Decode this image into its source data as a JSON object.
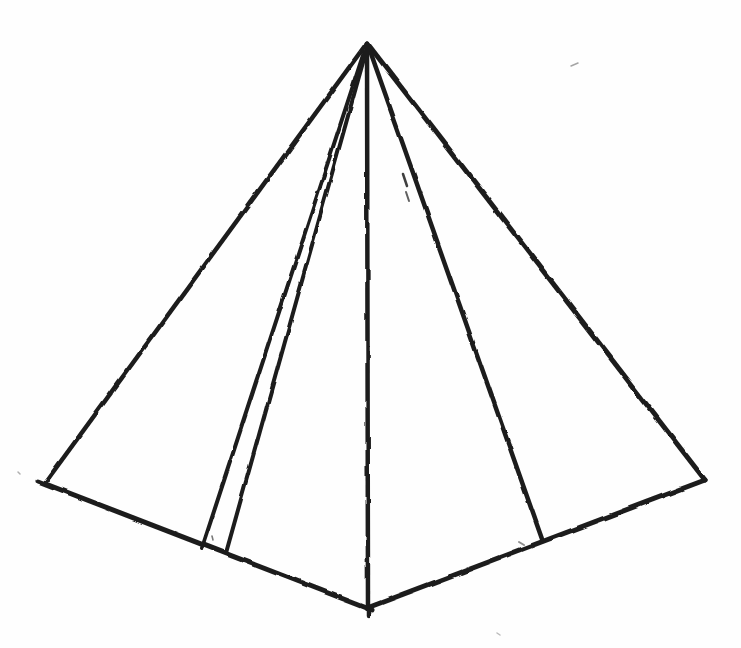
{
  "figure": {
    "shape": "hand-drawn-pyramid",
    "canvas": {
      "width": 741,
      "height": 648
    },
    "paper_color": "#fefefe",
    "ink_color": "#1d1d1d",
    "apex": {
      "x": 367,
      "y": 43
    },
    "base_vertices": [
      {
        "name": "base-left",
        "x": 45,
        "y": 483
      },
      {
        "name": "base-front-left-a",
        "x": 202,
        "y": 548
      },
      {
        "name": "base-front-left-b",
        "x": 226,
        "y": 553
      },
      {
        "name": "base-front-center",
        "x": 367,
        "y": 608
      },
      {
        "name": "base-front-right",
        "x": 542,
        "y": 539
      },
      {
        "name": "base-right",
        "x": 705,
        "y": 480
      }
    ],
    "edges": [
      {
        "name": "lateral-edge-left",
        "x1": 367,
        "y1": 43,
        "x2": 45,
        "y2": 483,
        "w": 4.5,
        "opacity": 1
      },
      {
        "name": "lateral-edge-inner-left-a",
        "x1": 364,
        "y1": 52,
        "x2": 202,
        "y2": 548,
        "w": 4,
        "opacity": 1
      },
      {
        "name": "lateral-edge-inner-left-b",
        "x1": 367,
        "y1": 48,
        "x2": 226,
        "y2": 553,
        "w": 4,
        "opacity": 1
      },
      {
        "name": "lateral-edge-center",
        "x1": 367,
        "y1": 43,
        "x2": 368,
        "y2": 616,
        "w": 4.5,
        "opacity": 1
      },
      {
        "name": "lateral-edge-inner-right",
        "x1": 368,
        "y1": 45,
        "x2": 542,
        "y2": 539,
        "w": 4.5,
        "opacity": 1
      },
      {
        "name": "lateral-edge-right",
        "x1": 367,
        "y1": 43,
        "x2": 705,
        "y2": 480,
        "w": 5,
        "opacity": 1
      },
      {
        "name": "base-edge-left",
        "x1": 38,
        "y1": 481,
        "x2": 372,
        "y2": 610,
        "w": 5,
        "opacity": 1
      },
      {
        "name": "base-edge-right",
        "x1": 367,
        "y1": 608,
        "x2": 705,
        "y2": 480,
        "w": 5,
        "opacity": 1
      }
    ],
    "stray_marks": [
      {
        "name": "pencil-tick-a",
        "x1": 403,
        "y1": 174,
        "x2": 407,
        "y2": 186,
        "w": 2.5,
        "opacity": 0.85
      },
      {
        "name": "pencil-tick-b",
        "x1": 406,
        "y1": 192,
        "x2": 409,
        "y2": 201,
        "w": 2,
        "opacity": 0.7
      },
      {
        "name": "faint-dash-top-right",
        "x1": 571,
        "y1": 66,
        "x2": 578,
        "y2": 63,
        "w": 1.5,
        "opacity": 0.4
      },
      {
        "name": "speck-between-inner-lines",
        "x1": 212,
        "y1": 536,
        "x2": 213,
        "y2": 540,
        "w": 1.5,
        "opacity": 0.6
      },
      {
        "name": "speck-near-inner-right-foot",
        "x1": 519,
        "y1": 542,
        "x2": 524,
        "y2": 545,
        "w": 2,
        "opacity": 0.5
      },
      {
        "name": "speck-left-margin",
        "x1": 18,
        "y1": 472,
        "x2": 20,
        "y2": 474,
        "w": 1.5,
        "opacity": 0.35
      },
      {
        "name": "speck-below-base",
        "x1": 497,
        "y1": 633,
        "x2": 500,
        "y2": 635,
        "w": 1.5,
        "opacity": 0.3
      }
    ]
  }
}
